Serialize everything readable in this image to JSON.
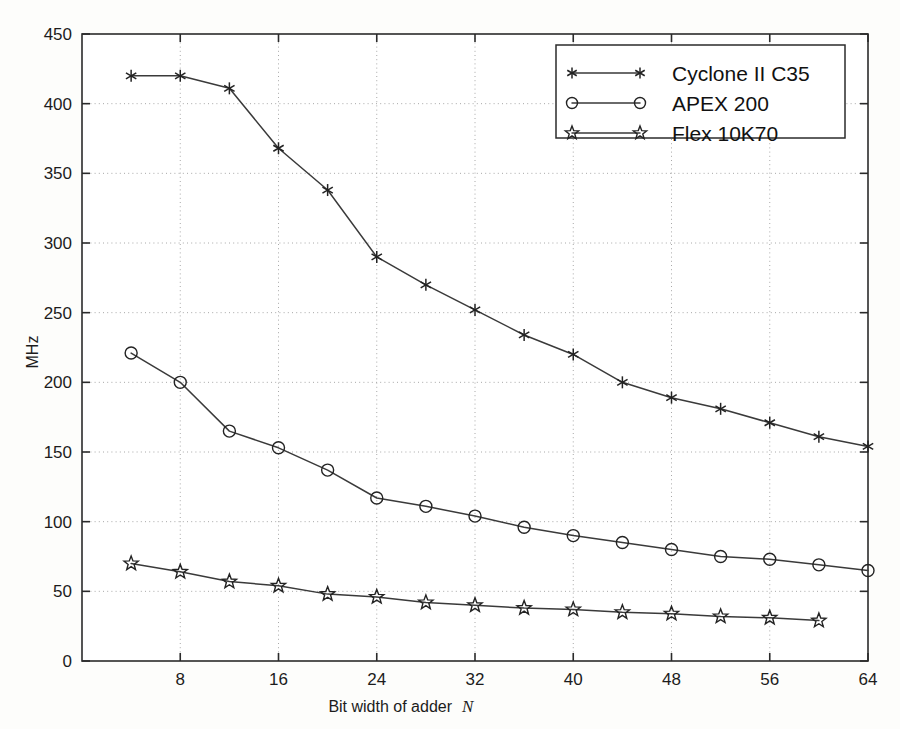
{
  "chart_data": {
    "type": "line",
    "title": "",
    "xlabel": "Bit width of adder  N",
    "xlabel_main": "Bit width of adder",
    "xlabel_symbol": "N",
    "ylabel": "MHz",
    "xlim": [
      0,
      64
    ],
    "ylim": [
      0,
      450
    ],
    "xticks": [
      8,
      16,
      24,
      32,
      40,
      48,
      56,
      64
    ],
    "xtick_labels": [
      "8",
      "16",
      "24",
      "32",
      "40",
      "48",
      "56",
      "64"
    ],
    "yticks": [
      0,
      50,
      100,
      150,
      200,
      250,
      300,
      350,
      400,
      450
    ],
    "ytick_labels": [
      "0",
      "50",
      "100",
      "150",
      "200",
      "250",
      "300",
      "350",
      "400",
      "450"
    ],
    "grid": true,
    "legend_position": "top-right",
    "series": [
      {
        "name": "Cyclone II C35",
        "marker": "asterisk",
        "x": [
          4,
          8,
          12,
          16,
          20,
          24,
          28,
          32,
          36,
          40,
          44,
          48,
          52,
          56,
          60,
          64
        ],
        "values": [
          420,
          420,
          411,
          368,
          338,
          290,
          270,
          252,
          234,
          220,
          200,
          189,
          181,
          171,
          161,
          154
        ]
      },
      {
        "name": "APEX 200",
        "marker": "circle",
        "x": [
          4,
          8,
          12,
          16,
          20,
          24,
          28,
          32,
          36,
          40,
          44,
          48,
          52,
          56,
          60,
          64
        ],
        "values": [
          221,
          200,
          165,
          153,
          137,
          117,
          111,
          104,
          96,
          90,
          85,
          80,
          75,
          73,
          69,
          65
        ]
      },
      {
        "name": "Flex 10K70",
        "marker": "star",
        "x": [
          4,
          8,
          12,
          16,
          20,
          24,
          28,
          32,
          36,
          40,
          44,
          48,
          52,
          56,
          60
        ],
        "values": [
          70,
          64,
          57,
          54,
          48,
          46,
          42,
          40,
          38,
          37,
          35,
          34,
          32,
          31,
          29
        ]
      }
    ]
  },
  "legend": {
    "entries": [
      {
        "label": "Cyclone II C35",
        "marker": "asterisk"
      },
      {
        "label": "APEX 200",
        "marker": "circle"
      },
      {
        "label": "Flex 10K70",
        "marker": "star"
      }
    ]
  },
  "colors": {
    "axis": "#2b2b2b",
    "line": "#3a3a3a",
    "marker": "#232323",
    "grid": "#a8a8a8",
    "background": "#fdfdfb",
    "plot_background": "#ffffff"
  }
}
